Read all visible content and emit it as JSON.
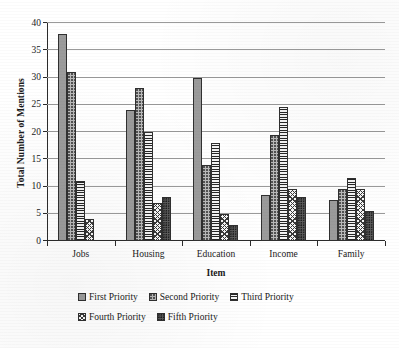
{
  "chart_data": {
    "type": "bar",
    "title": "",
    "xlabel": "Item",
    "ylabel": "Total Number of Mentions",
    "ylim": [
      0,
      40
    ],
    "ytick_step": 5,
    "yticks": [
      0,
      5,
      10,
      15,
      20,
      25,
      30,
      35,
      40
    ],
    "grid": true,
    "legend_position": "bottom",
    "categories": [
      "Jobs",
      "Housing",
      "Education",
      "Income",
      "Family"
    ],
    "series": [
      {
        "name": "First Priority",
        "values": [
          38,
          24,
          30,
          8.5,
          7.5
        ]
      },
      {
        "name": "Second Priority",
        "values": [
          31,
          28,
          14,
          19.5,
          9.5
        ]
      },
      {
        "name": "Third Priority",
        "values": [
          11,
          20,
          18,
          24.5,
          11.5
        ]
      },
      {
        "name": "Fourth Priority",
        "values": [
          4,
          7,
          5,
          9.5,
          9.5
        ]
      },
      {
        "name": "Fifth Priority",
        "values": [
          0,
          8,
          3,
          8,
          5.5
        ]
      }
    ]
  },
  "legend": {
    "items": [
      {
        "label": "First Priority"
      },
      {
        "label": "Second Priority"
      },
      {
        "label": "Third Priority"
      },
      {
        "label": "Fourth Priority"
      },
      {
        "label": "Fifth Priority"
      }
    ]
  }
}
